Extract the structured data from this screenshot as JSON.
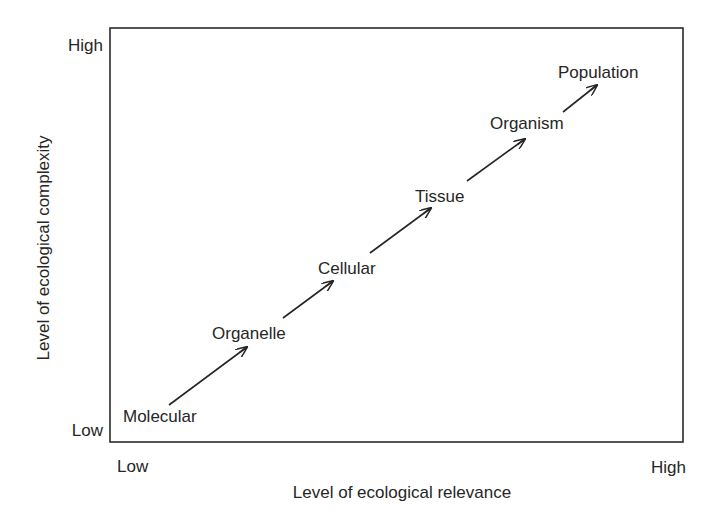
{
  "diagram": {
    "type": "conceptual-progression",
    "x_axis": {
      "title": "Level of ecological relevance",
      "low_label": "Low",
      "high_label": "High"
    },
    "y_axis": {
      "title": "Level of ecological complexity",
      "low_label": "Low",
      "high_label": "High"
    },
    "levels": [
      {
        "label": "Molecular"
      },
      {
        "label": "Organelle"
      },
      {
        "label": "Cellular"
      },
      {
        "label": "Tissue"
      },
      {
        "label": "Organism"
      },
      {
        "label": "Population"
      }
    ],
    "arrows": [
      {
        "from": "Molecular",
        "to": "Organelle"
      },
      {
        "from": "Organelle",
        "to": "Cellular"
      },
      {
        "from": "Cellular",
        "to": "Tissue"
      },
      {
        "from": "Tissue",
        "to": "Organism"
      },
      {
        "from": "Organism",
        "to": "Population"
      }
    ],
    "colors": {
      "ink": "#262626",
      "background": "#ffffff"
    }
  }
}
